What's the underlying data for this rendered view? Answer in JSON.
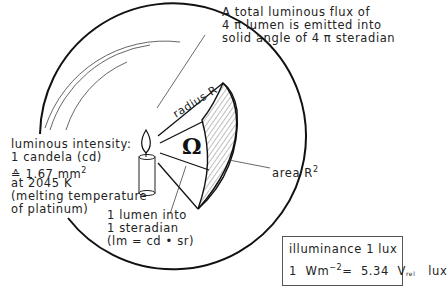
{
  "diagram": {
    "title_note": {
      "line1": "A total luminous flux of",
      "line2": "4 π lumen is emitted into",
      "line3": "solid angle of 4 π steradian"
    },
    "luminous_intensity": {
      "line1": "luminous intensity:",
      "line2": "1 candela (cd)",
      "line3_prefix": "≙ 1.67 mm",
      "line3_sup": "2",
      "line4": "at 2045 K",
      "line5": "(melting temperature",
      "line6": "of platinum)"
    },
    "lumen_note": {
      "line1": "1 lumen into",
      "line2": "1 steradian",
      "line3": "(lm = cd • sr)"
    },
    "radius_label": "radius R",
    "area_label": "area R",
    "area_sup": "2",
    "solid_angle_symbol": "Ω",
    "illuminance_box": {
      "line1": "illuminance 1 lux",
      "line2_prefix": "1  Wm",
      "line2_sup": "−2",
      "line2_mid": "=  5.34  V",
      "line2_sub": "rel",
      "line2_suffix": "   lux"
    },
    "icons": {
      "candle": "candle-icon",
      "sphere": "sphere-outline"
    },
    "colors": {
      "line": "#111111",
      "hatch": "#444444",
      "background": "#ffffff"
    }
  }
}
